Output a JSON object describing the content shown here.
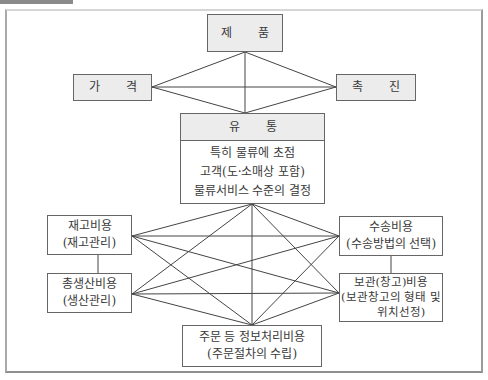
{
  "diagram": {
    "top": {
      "chars": [
        "제",
        "품"
      ],
      "label": "제 품"
    },
    "left": {
      "chars": [
        "가",
        "격"
      ],
      "label": "가 격"
    },
    "right": {
      "chars": [
        "촉",
        "진"
      ],
      "label": "촉 진"
    },
    "distribution": {
      "header_chars": [
        "유",
        "통"
      ],
      "header": "유 통",
      "lines": [
        "특히 물류에 초점",
        "고객(도·소매상 포함)",
        "물류서비스 수준의 결정"
      ]
    },
    "costs": {
      "inventory": {
        "line1": "재고비용",
        "line2": "(재고관리)"
      },
      "production": {
        "line1": "총생산비용",
        "line2": "(생산관리)"
      },
      "transport": {
        "line1": "수송비용",
        "line2": "(수송방법의 선택)"
      },
      "storage": {
        "line1": "보관(창고)비용",
        "line2": "(보관창고의 형태 및",
        "line3": "위치선정)"
      },
      "order": {
        "line1": "주문 등 정보처리비용",
        "line2": "(주문절차의 수립)"
      }
    },
    "colors": {
      "box_fill": "#ececec",
      "border": "#666666",
      "line": "#444444",
      "frame": "#a9a9a9"
    }
  }
}
